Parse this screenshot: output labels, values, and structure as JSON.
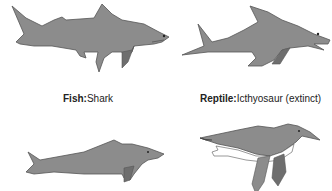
{
  "diagram": {
    "panels": [
      {
        "id": "shark",
        "category": "Fish",
        "name": "Shark",
        "separator": ":"
      },
      {
        "id": "ichthyosaur",
        "category": "Reptile",
        "name": "Icthyosaur (extinct)",
        "separator": ":"
      },
      {
        "id": "dolphin",
        "category": "",
        "name": ""
      },
      {
        "id": "penguin",
        "category": "",
        "name": ""
      }
    ],
    "colors": {
      "body": "#8c8c8c",
      "outline": "#555555",
      "dark_fin": "#6e6e6e",
      "belly": "#ffffff"
    }
  }
}
